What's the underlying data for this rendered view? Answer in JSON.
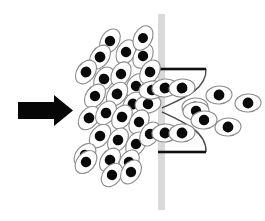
{
  "figure": {
    "canvas": {
      "width": 265,
      "height": 221,
      "background": "#ffffff"
    },
    "colors": {
      "nucleus": "#0a0a0a",
      "cell_outline": "#8a8a8a",
      "cell_fill": "#ffffff",
      "membrane": "#d9d9d9",
      "nozzle_bar": "#101010",
      "nozzle_wall": "#4a4a4a",
      "arrow": "#060606",
      "background": "#ffffff"
    },
    "flow_arrow": {
      "label": "flow-direction",
      "direction": "right",
      "shaft": {
        "x": 18,
        "y": 102,
        "width": 36,
        "height": 17
      },
      "head": {
        "x": 54,
        "y": 95,
        "width": 19,
        "height": 31
      }
    },
    "membrane": {
      "label": "membrane-barrier",
      "x": 158,
      "y": 14,
      "width": 7,
      "height": 196,
      "color": "#d9d9d9"
    },
    "aperture": {
      "label": "constriction-nozzle",
      "top_bar": {
        "x1": 158,
        "y1": 69,
        "x2": 206,
        "y2": 69,
        "thickness": 2.6
      },
      "bottom_bar": {
        "x1": 158,
        "y1": 152,
        "x2": 206,
        "y2": 152,
        "thickness": 2.6
      },
      "throat_y": 110,
      "throat_x": 162,
      "mouth_x": 206
    },
    "regions": {
      "upstream": {
        "label": "upstream-dense-suspension",
        "cell_count": 29
      },
      "aperture_zone": {
        "label": "aperture-cells",
        "cell_count": 6
      },
      "downstream": {
        "label": "downstream-sparse-suspension",
        "cell_count": 5
      }
    },
    "cells": [
      {
        "cx": 110,
        "cy": 41,
        "rx": 13,
        "ry": 9,
        "angle": -58,
        "nr": 5.2,
        "region": "upstream"
      },
      {
        "cx": 126,
        "cy": 52,
        "rx": 13,
        "ry": 9,
        "angle": -62,
        "nr": 5.2,
        "region": "upstream"
      },
      {
        "cx": 100,
        "cy": 57,
        "rx": 13,
        "ry": 9,
        "angle": -55,
        "nr": 5.4,
        "region": "upstream"
      },
      {
        "cx": 143,
        "cy": 56,
        "rx": 13,
        "ry": 9,
        "angle": -60,
        "nr": 5.2,
        "region": "upstream"
      },
      {
        "cx": 86,
        "cy": 72,
        "rx": 13,
        "ry": 9,
        "angle": -55,
        "nr": 5.4,
        "region": "upstream"
      },
      {
        "cx": 104,
        "cy": 79,
        "rx": 13,
        "ry": 9,
        "angle": -58,
        "nr": 5.3,
        "region": "upstream"
      },
      {
        "cx": 121,
        "cy": 74,
        "rx": 13,
        "ry": 9,
        "angle": -60,
        "nr": 5.2,
        "region": "upstream"
      },
      {
        "cx": 136,
        "cy": 86,
        "rx": 13,
        "ry": 9,
        "angle": -62,
        "nr": 5.2,
        "region": "upstream"
      },
      {
        "cx": 150,
        "cy": 72,
        "rx": 13,
        "ry": 9,
        "angle": -58,
        "nr": 5.3,
        "region": "upstream"
      },
      {
        "cx": 117,
        "cy": 94,
        "rx": 13,
        "ry": 9,
        "angle": -52,
        "nr": 5.4,
        "region": "upstream"
      },
      {
        "cx": 95,
        "cy": 96,
        "rx": 13,
        "ry": 9,
        "angle": -55,
        "nr": 5.2,
        "region": "upstream"
      },
      {
        "cx": 133,
        "cy": 104,
        "rx": 13,
        "ry": 9,
        "angle": -58,
        "nr": 5.4,
        "region": "upstream"
      },
      {
        "cx": 148,
        "cy": 104,
        "rx": 13,
        "ry": 9,
        "angle": -10,
        "nr": 5.3,
        "region": "upstream"
      },
      {
        "cx": 89,
        "cy": 118,
        "rx": 13,
        "ry": 9,
        "angle": -52,
        "nr": 5.4,
        "region": "upstream"
      },
      {
        "cx": 106,
        "cy": 113,
        "rx": 13,
        "ry": 9,
        "angle": -56,
        "nr": 5.3,
        "region": "upstream"
      },
      {
        "cx": 122,
        "cy": 117,
        "rx": 13,
        "ry": 9,
        "angle": -58,
        "nr": 5.3,
        "region": "upstream"
      },
      {
        "cx": 139,
        "cy": 122,
        "rx": 13,
        "ry": 9,
        "angle": -60,
        "nr": 5.2,
        "region": "upstream"
      },
      {
        "cx": 100,
        "cy": 136,
        "rx": 13,
        "ry": 9,
        "angle": -52,
        "nr": 5.3,
        "region": "upstream"
      },
      {
        "cx": 118,
        "cy": 140,
        "rx": 13,
        "ry": 9,
        "angle": -56,
        "nr": 5.3,
        "region": "upstream"
      },
      {
        "cx": 136,
        "cy": 144,
        "rx": 13,
        "ry": 9,
        "angle": -58,
        "nr": 5.2,
        "region": "upstream"
      },
      {
        "cx": 150,
        "cy": 134,
        "rx": 13,
        "ry": 9,
        "angle": -58,
        "nr": 5.2,
        "region": "upstream"
      },
      {
        "cx": 85,
        "cy": 155,
        "rx": 13,
        "ry": 9,
        "angle": -50,
        "nr": 5.3,
        "region": "upstream"
      },
      {
        "cx": 110,
        "cy": 160,
        "rx": 13,
        "ry": 9,
        "angle": -55,
        "nr": 5.3,
        "region": "upstream"
      },
      {
        "cx": 129,
        "cy": 162,
        "rx": 13,
        "ry": 9,
        "angle": -58,
        "nr": 5.2,
        "region": "upstream"
      },
      {
        "cx": 112,
        "cy": 175,
        "rx": 13,
        "ry": 9,
        "angle": -52,
        "nr": 5.2,
        "region": "upstream"
      },
      {
        "cx": 131,
        "cy": 172,
        "rx": 13,
        "ry": 9,
        "angle": -56,
        "nr": 5.2,
        "region": "upstream"
      },
      {
        "cx": 86,
        "cy": 162,
        "rx": 13,
        "ry": 9,
        "angle": -50,
        "nr": 5.2,
        "region": "upstream"
      },
      {
        "cx": 143,
        "cy": 38,
        "rx": 13,
        "ry": 9,
        "angle": -62,
        "nr": 5.0,
        "region": "upstream"
      },
      {
        "cx": 152,
        "cy": 90,
        "rx": 13,
        "ry": 9,
        "angle": -8,
        "nr": 5.2,
        "region": "upstream"
      },
      {
        "cx": 165,
        "cy": 88,
        "rx": 13,
        "ry": 9,
        "angle": -6,
        "nr": 5.4,
        "region": "aperture"
      },
      {
        "cx": 182,
        "cy": 88,
        "rx": 13,
        "ry": 9,
        "angle": -6,
        "nr": 5.4,
        "region": "aperture"
      },
      {
        "cx": 195,
        "cy": 107,
        "rx": 13,
        "ry": 9,
        "angle": -4,
        "nr": 5.4,
        "region": "aperture"
      },
      {
        "cx": 165,
        "cy": 133,
        "rx": 13,
        "ry": 9,
        "angle": -4,
        "nr": 5.4,
        "region": "aperture"
      },
      {
        "cx": 182,
        "cy": 133,
        "rx": 13,
        "ry": 9,
        "angle": -4,
        "nr": 5.4,
        "region": "aperture"
      },
      {
        "cx": 196,
        "cy": 111,
        "rx": 13,
        "ry": 9,
        "angle": -4,
        "nr": 5.2,
        "region": "aperture"
      },
      {
        "cx": 219,
        "cy": 95,
        "rx": 13,
        "ry": 9,
        "angle": -4,
        "nr": 5.4,
        "region": "downstream"
      },
      {
        "cx": 248,
        "cy": 103,
        "rx": 13,
        "ry": 9,
        "angle": -4,
        "nr": 5.4,
        "region": "downstream"
      },
      {
        "cx": 228,
        "cy": 127,
        "rx": 13,
        "ry": 9,
        "angle": -4,
        "nr": 5.4,
        "region": "downstream"
      },
      {
        "cx": 204,
        "cy": 120,
        "rx": 13,
        "ry": 9,
        "angle": -4,
        "nr": 5.2,
        "region": "downstream"
      }
    ]
  }
}
